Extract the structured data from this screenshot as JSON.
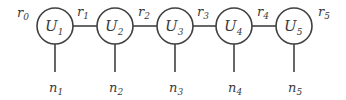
{
  "diagram": {
    "type": "tensor-network-chain",
    "stroke_color": "#404040",
    "text_color": "#3a3a3a",
    "nodes": [
      {
        "label": "U",
        "sub": "1",
        "cx": 55
      },
      {
        "label": "U",
        "sub": "2",
        "cx": 115
      },
      {
        "label": "U",
        "sub": "3",
        "cx": 175
      },
      {
        "label": "U",
        "sub": "4",
        "cx": 234
      },
      {
        "label": "U",
        "sub": "5",
        "cx": 294
      }
    ],
    "bond_labels": [
      {
        "label": "r",
        "sub": "0",
        "x": 17
      },
      {
        "label": "r",
        "sub": "1",
        "x": 77
      },
      {
        "label": "r",
        "sub": "2",
        "x": 138
      },
      {
        "label": "r",
        "sub": "3",
        "x": 197
      },
      {
        "label": "r",
        "sub": "4",
        "x": 257
      },
      {
        "label": "r",
        "sub": "5",
        "x": 318
      }
    ],
    "leg_labels": [
      {
        "label": "n",
        "sub": "1",
        "x": 49
      },
      {
        "label": "n",
        "sub": "2",
        "x": 109
      },
      {
        "label": "n",
        "sub": "3",
        "x": 169
      },
      {
        "label": "n",
        "sub": "4",
        "x": 228
      },
      {
        "label": "n",
        "sub": "5",
        "x": 288
      }
    ]
  }
}
